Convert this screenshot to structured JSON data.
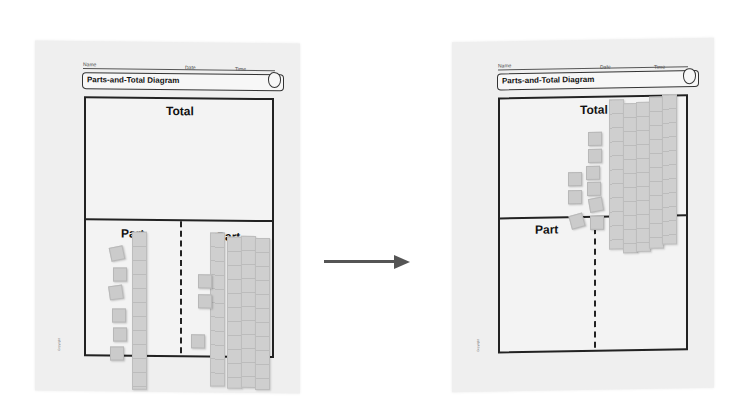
{
  "left_sheet": {
    "header": {
      "name_label": "Name",
      "date_label": "Date",
      "time_label": "Time"
    },
    "title": "Parts-and-Total Diagram",
    "icon": "apple-icon",
    "total_label": "Total",
    "part_left_label": "Part",
    "part_right_label": "Part",
    "part_left": {
      "tens_rods": 1,
      "unit_cubes": 6
    },
    "part_right": {
      "tens_rods": 4,
      "unit_cubes": 3
    }
  },
  "right_sheet": {
    "header": {
      "name_label": "Name",
      "date_label": "Date",
      "time_label": "Time"
    },
    "title": "Parts-and-Total Diagram",
    "icon": "apple-icon",
    "total_label": "Total",
    "part_left_label": "Part",
    "part_right_label": "Part",
    "total": {
      "tens_rods": 5,
      "unit_cubes": 9
    }
  },
  "arrow": {
    "direction": "right",
    "color": "#555555"
  }
}
